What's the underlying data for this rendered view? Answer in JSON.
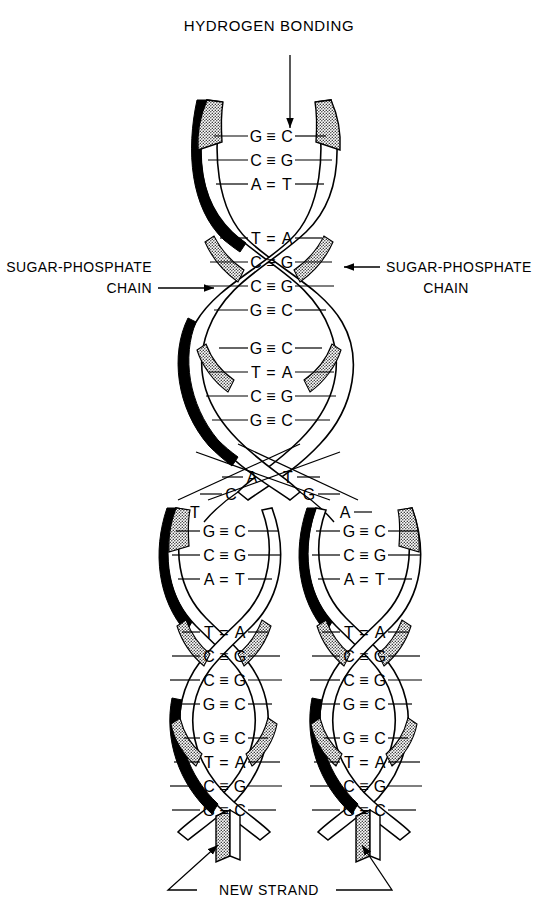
{
  "figure": {
    "type": "dna-replication-diagram",
    "title": "HYDROGEN BONDING",
    "labels": {
      "hydrogen_bonding": "HYDROGEN BONDING",
      "sugar_phosphate_left_line1": "SUGAR-PHOSPHATE",
      "sugar_phosphate_left_line2": "CHAIN",
      "sugar_phosphate_right_line1": "SUGAR-PHOSPHATE",
      "sugar_phosphate_right_line2": "CHAIN",
      "new_strand": "NEW STRAND"
    },
    "bond_symbols": {
      "triple": "≡",
      "double": "="
    },
    "parent_segments": [
      {
        "name": "segment-1",
        "pairs": [
          {
            "left": "G",
            "bond": "≡",
            "right": "C"
          },
          {
            "left": "C",
            "bond": "≡",
            "right": "G"
          },
          {
            "left": "A",
            "bond": "=",
            "right": "T"
          }
        ]
      },
      {
        "name": "segment-2",
        "pairs": [
          {
            "left": "T",
            "bond": "=",
            "right": "A"
          },
          {
            "left": "C",
            "bond": "≡",
            "right": "G"
          },
          {
            "left": "C",
            "bond": "≡",
            "right": "G"
          },
          {
            "left": "G",
            "bond": "≡",
            "right": "C"
          }
        ]
      },
      {
        "name": "segment-3",
        "pairs": [
          {
            "left": "G",
            "bond": "≡",
            "right": "C"
          },
          {
            "left": "T",
            "bond": "=",
            "right": "A"
          },
          {
            "left": "C",
            "bond": "≡",
            "right": "G"
          },
          {
            "left": "G",
            "bond": "≡",
            "right": "C"
          }
        ]
      }
    ],
    "fork_unpaired_bases": {
      "row1_left": "A",
      "row1_right": "T",
      "row2_left": "C",
      "row2_right": "G",
      "row3_left": "T",
      "row3_right": "A"
    },
    "left_branch_segments": [
      {
        "name": "left-segment-1",
        "pairs": [
          {
            "left": "G",
            "bond": "≡",
            "right": "C"
          },
          {
            "left": "C",
            "bond": "≡",
            "right": "G"
          },
          {
            "left": "A",
            "bond": "=",
            "right": "T"
          }
        ]
      },
      {
        "name": "left-segment-2",
        "pairs": [
          {
            "left": "T",
            "bond": "=",
            "right": "A"
          },
          {
            "left": "C",
            "bond": "≡",
            "right": "G"
          },
          {
            "left": "C",
            "bond": "≡",
            "right": "G"
          },
          {
            "left": "G",
            "bond": "≡",
            "right": "C"
          }
        ]
      },
      {
        "name": "left-segment-3",
        "pairs": [
          {
            "left": "G",
            "bond": "≡",
            "right": "C"
          },
          {
            "left": "T",
            "bond": "=",
            "right": "A"
          },
          {
            "left": "C",
            "bond": "≡",
            "right": "G"
          },
          {
            "left": "G",
            "bond": "≡",
            "right": "C"
          }
        ]
      }
    ],
    "right_branch_segments": [
      {
        "name": "right-segment-1",
        "pairs": [
          {
            "left": "G",
            "bond": "≡",
            "right": "C"
          },
          {
            "left": "C",
            "bond": "≡",
            "right": "G"
          },
          {
            "left": "A",
            "bond": "=",
            "right": "T"
          }
        ]
      },
      {
        "name": "right-segment-2",
        "pairs": [
          {
            "left": "T",
            "bond": "=",
            "right": "A"
          },
          {
            "left": "C",
            "bond": "≡",
            "right": "G"
          },
          {
            "left": "C",
            "bond": "≡",
            "right": "G"
          },
          {
            "left": "G",
            "bond": "≡",
            "right": "C"
          }
        ]
      },
      {
        "name": "right-segment-3",
        "pairs": [
          {
            "left": "G",
            "bond": "≡",
            "right": "C"
          },
          {
            "left": "T",
            "bond": "=",
            "right": "A"
          },
          {
            "left": "C",
            "bond": "≡",
            "right": "G"
          },
          {
            "left": "G",
            "bond": "≡",
            "right": "C"
          }
        ]
      }
    ],
    "colors": {
      "ink": "#000000",
      "paper": "#ffffff",
      "stipple": "#9a9a9a"
    }
  }
}
